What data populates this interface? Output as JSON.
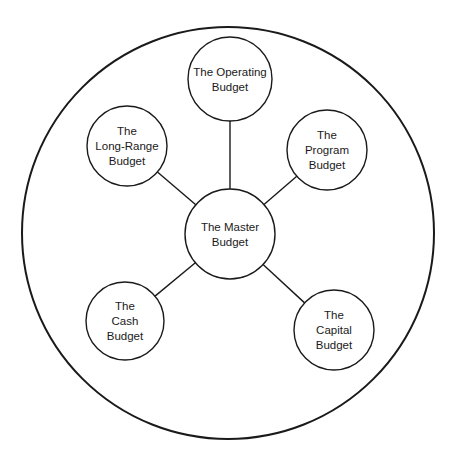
{
  "diagram": {
    "type": "hub-and-spoke",
    "outer_boundary": {
      "cx": 228,
      "cy": 233,
      "r": 206
    },
    "stroke_color": "#1a1a1a",
    "background": "#ffffff",
    "center_node": {
      "id": "master",
      "lines": [
        "The Master",
        "Budget"
      ],
      "cx": 230,
      "cy": 234,
      "r": 45
    },
    "nodes": [
      {
        "id": "operating",
        "lines": [
          "The Operating",
          "Budget"
        ],
        "cx": 230,
        "cy": 79,
        "r": 42
      },
      {
        "id": "program",
        "lines": [
          "The",
          "Program",
          "Budget"
        ],
        "cx": 327,
        "cy": 150,
        "r": 40
      },
      {
        "id": "capital",
        "lines": [
          "The",
          "Capital",
          "Budget"
        ],
        "cx": 334,
        "cy": 330,
        "r": 40
      },
      {
        "id": "cash",
        "lines": [
          "The",
          "Cash",
          "Budget"
        ],
        "cx": 125,
        "cy": 321,
        "r": 39
      },
      {
        "id": "long-range",
        "lines": [
          "The",
          "Long-Range",
          "Budget"
        ],
        "cx": 127,
        "cy": 146,
        "r": 40
      }
    ],
    "edges": [
      {
        "from": "master",
        "to": "operating"
      },
      {
        "from": "master",
        "to": "program"
      },
      {
        "from": "master",
        "to": "capital"
      },
      {
        "from": "master",
        "to": "cash"
      },
      {
        "from": "master",
        "to": "long-range"
      }
    ]
  }
}
